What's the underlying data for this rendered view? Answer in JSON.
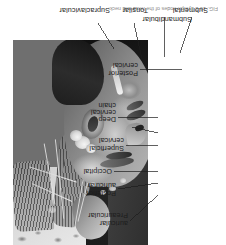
{
  "figure": {
    "orientation_degrees": 180,
    "caption": "FIG. 16-2  Lymph nodes of the head and neck.",
    "plate": {
      "name": "head-and-neck-lymph-node-photograph",
      "description": "Cadaver dissection photograph of the lateral head and neck showing lymph node groups"
    },
    "labels": [
      {
        "id": "submandibular",
        "text": "Submandibular",
        "lines": [
          "Submandibular"
        ]
      },
      {
        "id": "submental",
        "text": "Submental",
        "lines": [
          "Submental"
        ]
      },
      {
        "id": "tonsilar",
        "text": "Tonsilar",
        "lines": [
          "Tonsilar"
        ]
      },
      {
        "id": "supraclavicular",
        "text": "Supraclavicular",
        "lines": [
          "Supraclavicular"
        ]
      },
      {
        "id": "posterior-cervical",
        "text": "Posterior cervical",
        "lines": [
          "Posterior",
          "cervical"
        ]
      },
      {
        "id": "deep-cervical-chain",
        "text": "Deep cervical chain",
        "lines": [
          "Deep",
          "cervical",
          "chain"
        ]
      },
      {
        "id": "superficial-cervical",
        "text": "Superficial cervical",
        "lines": [
          "Superficial",
          "cervical"
        ]
      },
      {
        "id": "occipital",
        "text": "Occipital",
        "lines": [
          "Occipital"
        ]
      },
      {
        "id": "posterior-auricular",
        "text": "Posterior auricular",
        "lines": [
          "Posterior",
          "auricular"
        ]
      },
      {
        "id": "preauricular",
        "text": "Preauricular",
        "lines": [
          "Preauricular",
          "auricular"
        ]
      }
    ],
    "colors": {
      "page_background": "#ffffff",
      "label_text": "#1c1c1c",
      "caption_text": "#8d8d8d",
      "leader_line": "#1c1c1c",
      "plate_dark": "#1d1d1d",
      "plate_mid": "#6f6f6f",
      "plate_light": "#e8e8e8"
    }
  }
}
